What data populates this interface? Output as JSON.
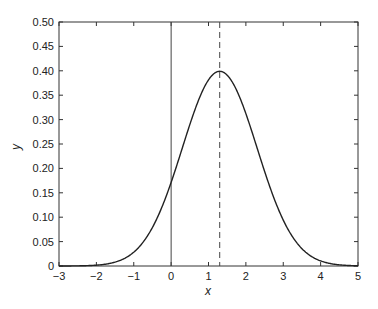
{
  "chart_data": {
    "type": "line",
    "title": "",
    "xlabel": "x",
    "ylabel": "y",
    "xlim": [
      -3,
      5
    ],
    "ylim": [
      0,
      0.5
    ],
    "grid": false,
    "legend": null,
    "x_ticks": [
      "−3",
      "−2",
      "−1",
      "0",
      "1",
      "2",
      "3",
      "4",
      "5"
    ],
    "y_ticks": [
      "0",
      "0.05",
      "0.10",
      "0.15",
      "0.20",
      "0.25",
      "0.30",
      "0.35",
      "0.40",
      "0.45",
      "0.50"
    ],
    "series": [
      {
        "name": "normal pdf",
        "style": "solid",
        "mean": 1.3,
        "std": 1.0,
        "x": [
          -3,
          -2.5,
          -2,
          -1.5,
          -1,
          -0.5,
          0,
          0.5,
          1,
          1.3,
          1.5,
          2,
          2.5,
          3,
          3.5,
          4,
          4.5,
          5
        ],
        "y": [
          0.0,
          0.0003,
          0.0017,
          0.0079,
          0.0283,
          0.079,
          0.1714,
          0.2897,
          0.3814,
          0.3989,
          0.391,
          0.3123,
          0.1942,
          0.094,
          0.0355,
          0.0104,
          0.0024,
          0.0004
        ]
      }
    ],
    "annotations": [
      {
        "type": "vline",
        "x": 0,
        "style": "solid"
      },
      {
        "type": "vline",
        "x": 1.3,
        "style": "dashed",
        "label": "mean"
      }
    ]
  }
}
